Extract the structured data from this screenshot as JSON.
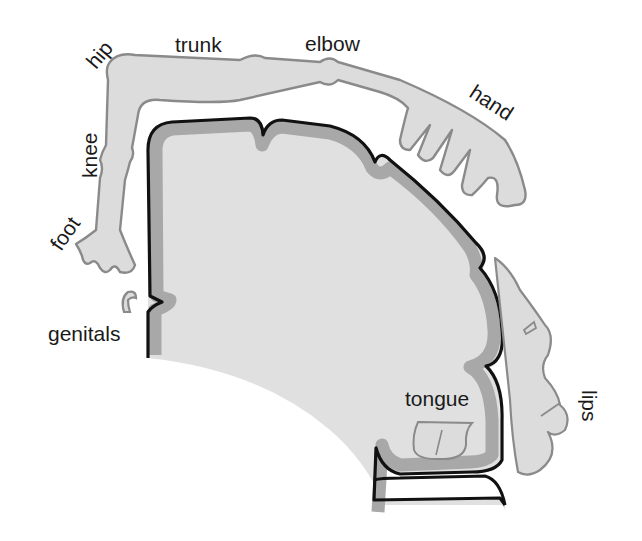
{
  "diagram": {
    "colors": {
      "background": "#ffffff",
      "cortex_fill": "#e0e0e0",
      "gray_matter_band": "#a8a8a8",
      "outline": "#111111",
      "body_fill": "#dcdcdc",
      "body_outline": "#8a8a8a",
      "label_text": "#1a1a1a"
    },
    "labels": {
      "hip": "hip",
      "trunk": "trunk",
      "elbow": "elbow",
      "hand": "hand",
      "knee": "knee",
      "foot": "foot",
      "genitals": "genitals",
      "tongue": "tongue",
      "lips": "lips"
    }
  }
}
